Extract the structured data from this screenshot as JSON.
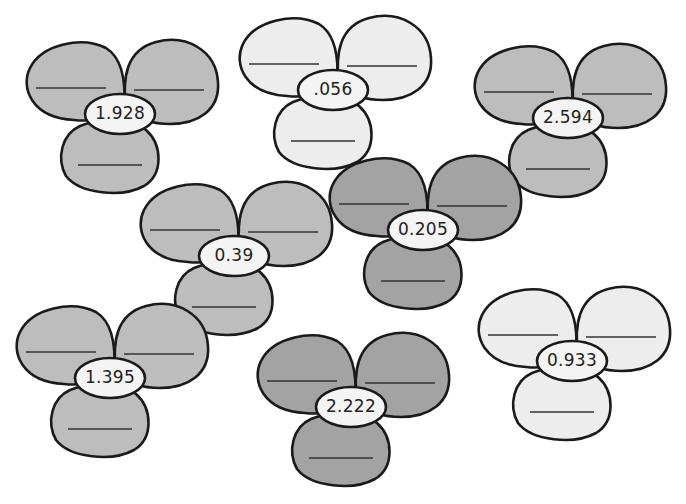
{
  "worksheet": {
    "colors": {
      "outline": "#1a1a1a",
      "dark": "#a3a3a3",
      "medium": "#bdbdbd",
      "light": "#ededed",
      "center": "#f4f4f4",
      "answer_line": "#333333"
    },
    "flowers": [
      {
        "id": "f1",
        "center_value": "1.928",
        "shade": "medium",
        "x": 22,
        "y": 38
      },
      {
        "id": "f2",
        "center_value": ".056",
        "shade": "light",
        "x": 235,
        "y": 14
      },
      {
        "id": "f3",
        "center_value": "2.594",
        "shade": "medium",
        "x": 470,
        "y": 42
      },
      {
        "id": "f4",
        "center_value": "0.39",
        "shade": "medium",
        "x": 136,
        "y": 180
      },
      {
        "id": "f5",
        "center_value": "0.205",
        "shade": "dark",
        "x": 325,
        "y": 154
      },
      {
        "id": "f6",
        "center_value": "1.395",
        "shade": "medium",
        "x": 12,
        "y": 302
      },
      {
        "id": "f7",
        "center_value": "2.222",
        "shade": "dark",
        "x": 253,
        "y": 331
      },
      {
        "id": "f8",
        "center_value": "0.933",
        "shade": "light",
        "x": 474,
        "y": 285
      }
    ],
    "answer_blanks_per_flower": 3
  }
}
